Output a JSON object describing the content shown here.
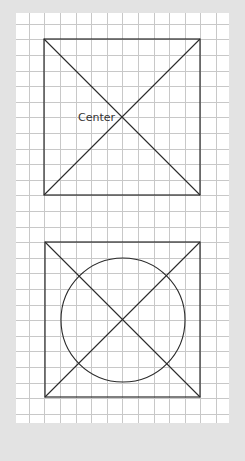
{
  "diagram": {
    "background_color": "#e3e3e3",
    "paper": {
      "x": 16,
      "y": 13,
      "width": 213,
      "height": 410,
      "color": "#ffffff"
    },
    "grid": {
      "origin_x": 13.2,
      "origin_y": 8.2,
      "spacing": 15.6,
      "color": "#c8c8c8"
    },
    "stroke_color": "#2a2a2a",
    "figures": [
      {
        "id": "square-with-diagonals",
        "square": {
          "x": 44,
          "y": 39,
          "size": 156
        },
        "diagonals": true,
        "center": {
          "x": 122,
          "y": 117
        },
        "label": {
          "text": "Center",
          "x": 78,
          "y": 121
        }
      },
      {
        "id": "square-with-circle-and-diagonals",
        "square": {
          "x": 45,
          "y": 242,
          "size": 155
        },
        "diagonals": true,
        "circle": {
          "cx": 123,
          "cy": 320,
          "r": 62
        }
      }
    ]
  }
}
